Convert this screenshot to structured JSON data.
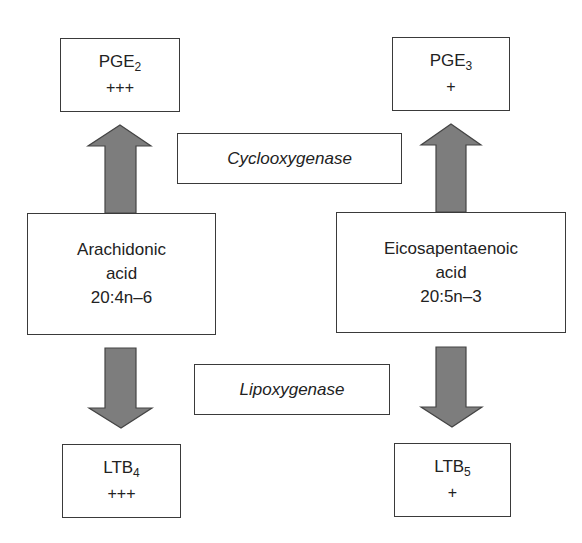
{
  "diagram": {
    "enzymes": {
      "cyclooxygenase": "Cyclooxygenase",
      "lipoxygenase": "Lipoxygenase"
    },
    "substrates": {
      "arachidonic": {
        "line1": "Arachidonic",
        "line2": "acid",
        "line3": "20:4n–6"
      },
      "eicosapentaenoic": {
        "line1": "Eicosapentaenoic",
        "line2": "acid",
        "line3": "20:5n–3"
      }
    },
    "products": {
      "pge2": {
        "name": "PGE",
        "subscript": "2",
        "level": "+++"
      },
      "pge3": {
        "name": "PGE",
        "subscript": "3",
        "level": "+"
      },
      "ltb4": {
        "name": "LTB",
        "subscript": "4",
        "level": "+++"
      },
      "ltb5": {
        "name": "LTB",
        "subscript": "5",
        "level": "+"
      }
    },
    "colors": {
      "arrow_fill": "#7d7d7d",
      "box_border": "#3a3a3a"
    },
    "edges": [
      {
        "from": "Arachidonic acid",
        "to": "PGE2",
        "via": "Cyclooxygenase"
      },
      {
        "from": "Eicosapentaenoic acid",
        "to": "PGE3",
        "via": "Cyclooxygenase"
      },
      {
        "from": "Arachidonic acid",
        "to": "LTB4",
        "via": "Lipoxygenase"
      },
      {
        "from": "Eicosapentaenoic acid",
        "to": "LTB5",
        "via": "Lipoxygenase"
      }
    ]
  }
}
